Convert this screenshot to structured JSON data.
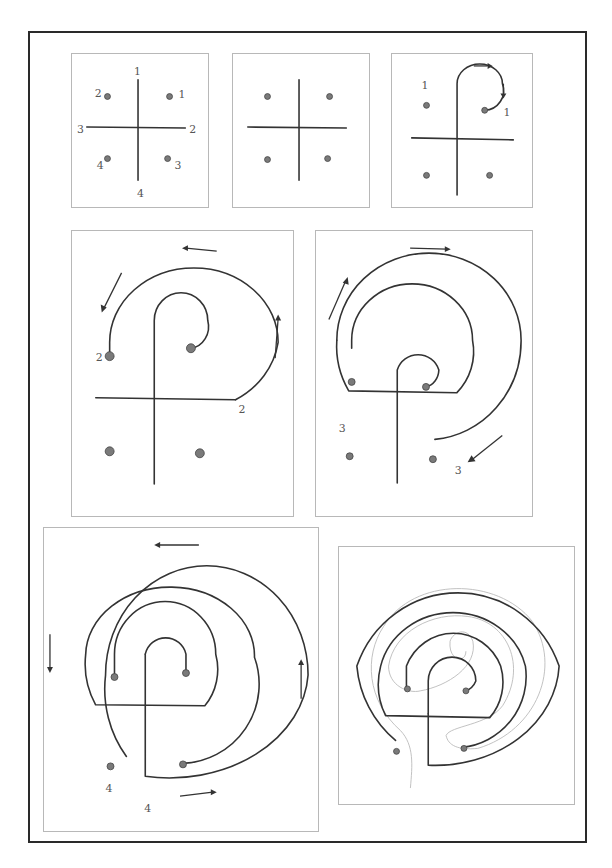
{
  "figure": {
    "steps": [
      {
        "id": 1,
        "description": "Seed pattern: cross with four dots, endpoints numbered",
        "labels": {
          "cross_top": "1",
          "cross_right": "2",
          "cross_left": "3",
          "cross_bottom": "4",
          "dot_top_left": "2",
          "dot_top_right": "1",
          "dot_bottom_left": "4",
          "dot_bottom_right": "3"
        }
      },
      {
        "id": 2,
        "description": "Seed pattern without numbers"
      },
      {
        "id": 3,
        "description": "Connect top of cross (1) to top-right dot (1)",
        "labels": {
          "start": "1",
          "end": "1"
        }
      },
      {
        "id": 4,
        "description": "Connect top-left dot (2) to right arm of cross (2)",
        "labels": {
          "start": "2",
          "end": "2"
        }
      },
      {
        "id": 5,
        "description": "Connect left arm of cross (3) to bottom-right dot (3)",
        "labels": {
          "start": "3",
          "end": "3"
        }
      },
      {
        "id": 6,
        "description": "Connect bottom-left dot (4) to bottom of cross (4)",
        "labels": {
          "start": "4",
          "end": "4"
        }
      },
      {
        "id": 7,
        "description": "Completed labyrinth with walking path traced in grey"
      }
    ],
    "colors": {
      "line": "#333333",
      "dot": "#7a7a7a",
      "panel_border": "#b8b8b8",
      "frame": "#2a2a2a",
      "path_trace": "#bbbbbb"
    }
  }
}
